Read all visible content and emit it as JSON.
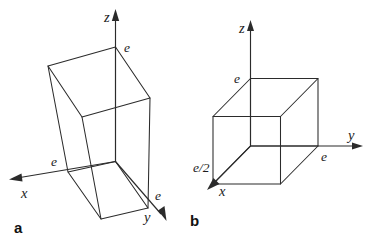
{
  "figure": {
    "background_color": "#ffffff",
    "line_color": "#2b2b2b",
    "text_color": "#1c1c1c",
    "width": 379,
    "height": 247
  },
  "panels": [
    {
      "key": "a",
      "label": "a",
      "shape": "parallelepiped",
      "description": "Slanted (triclinic/rhombohedral) unit cell drawn on x, y, z axes",
      "axes": [
        {
          "name": "x",
          "label": "x"
        },
        {
          "name": "y",
          "label": "y"
        },
        {
          "name": "z",
          "label": "z"
        }
      ],
      "intercepts": [
        {
          "axis": "x",
          "label": "e"
        },
        {
          "axis": "y",
          "label": "e"
        },
        {
          "axis": "z",
          "label": "e"
        }
      ]
    },
    {
      "key": "b",
      "label": "b",
      "shape": "cube",
      "description": "Cubic unit cell drawn on x, y, z axes",
      "axes": [
        {
          "name": "x",
          "label": "x"
        },
        {
          "name": "y",
          "label": "y"
        },
        {
          "name": "z",
          "label": "z"
        }
      ],
      "intercepts": [
        {
          "axis": "x",
          "label": "e/2"
        },
        {
          "axis": "y",
          "label": "e"
        },
        {
          "axis": "z",
          "label": "e"
        }
      ]
    }
  ]
}
